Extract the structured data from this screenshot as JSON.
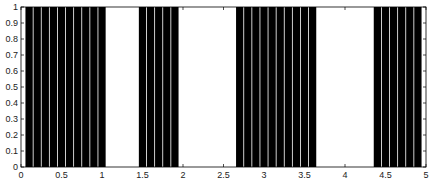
{
  "chart_data": {
    "type": "bar",
    "title": "",
    "xlabel": "",
    "ylabel": "",
    "xlim": [
      0,
      5
    ],
    "ylim": [
      0,
      1
    ],
    "grid": false,
    "legend": null,
    "bar_color": "#000000",
    "bar_width": 0.09,
    "x": [
      0.1,
      0.2,
      0.3,
      0.4,
      0.5,
      0.6,
      0.7,
      0.8,
      0.9,
      1.0,
      1.5,
      1.6,
      1.7,
      1.8,
      1.9,
      2.7,
      2.8,
      2.9,
      3.0,
      3.1,
      3.2,
      3.3,
      3.4,
      3.5,
      3.6,
      4.4,
      4.5,
      4.6,
      4.7,
      4.8,
      4.9
    ],
    "values": [
      1,
      1,
      1,
      1,
      1,
      1,
      1,
      1,
      1,
      1,
      1,
      1,
      1,
      1,
      1,
      1,
      1,
      1,
      1,
      1,
      1,
      1,
      1,
      1,
      1,
      1,
      1,
      1,
      1,
      1,
      1
    ],
    "xticks": [
      0,
      0.5,
      1,
      1.5,
      2,
      2.5,
      3,
      3.5,
      4,
      4.5,
      5
    ],
    "xtick_labels": [
      "0",
      "0.5",
      "1",
      "1.5",
      "2",
      "2.5",
      "3",
      "3.5",
      "4",
      "4.5",
      "5"
    ],
    "yticks": [
      0,
      0.1,
      0.2,
      0.3,
      0.4,
      0.5,
      0.6,
      0.7,
      0.8,
      0.9,
      1
    ],
    "ytick_labels": [
      "0",
      "0.1",
      "0.2",
      "0.3",
      "0.4",
      "0.5",
      "0.6",
      "0.7",
      "0.8",
      "0.9",
      "1"
    ]
  }
}
